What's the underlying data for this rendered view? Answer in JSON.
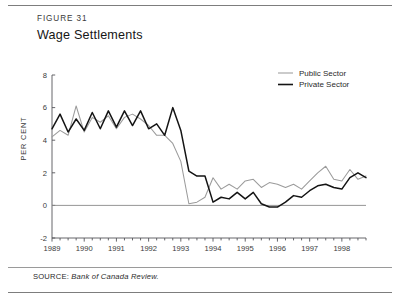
{
  "figure": {
    "label": "FIGURE 31",
    "title": "Wage Settlements",
    "source_key": "SOURCE:",
    "source_value": "Bank of Canada Review."
  },
  "legend": {
    "position": "top-right",
    "items": [
      {
        "label": "Public  Sector",
        "color": "#9b9b9b"
      },
      {
        "label": "Private Sector",
        "color": "#141414"
      }
    ]
  },
  "axes": {
    "ylabel": "PER CENT",
    "yticks": [
      "8",
      "6",
      "4",
      "2",
      "0",
      "-2"
    ],
    "xticks": [
      "1989",
      "1990",
      "1991",
      "1992",
      "1993",
      "1994",
      "1995",
      "1996",
      "1997",
      "1998"
    ]
  },
  "chart_data": {
    "type": "line",
    "title": "Wage Settlements",
    "xlabel": "",
    "ylabel": "PER CENT",
    "ylim": [
      -2,
      8
    ],
    "xlim": [
      1989.0,
      1998.75
    ],
    "grid": false,
    "legend_position": "top-right",
    "zero_line": 0,
    "x": [
      1989.0,
      1989.25,
      1989.5,
      1989.75,
      1990.0,
      1990.25,
      1990.5,
      1990.75,
      1991.0,
      1991.25,
      1991.5,
      1991.75,
      1992.0,
      1992.25,
      1992.5,
      1992.75,
      1993.0,
      1993.25,
      1993.5,
      1993.75,
      1994.0,
      1994.25,
      1994.5,
      1994.75,
      1995.0,
      1995.25,
      1995.5,
      1995.75,
      1996.0,
      1996.25,
      1996.5,
      1996.75,
      1997.0,
      1997.25,
      1997.5,
      1997.75,
      1998.0,
      1998.25,
      1998.5,
      1998.75
    ],
    "series": [
      {
        "name": "Public  Sector",
        "color": "#9b9b9b",
        "values": [
          4.2,
          4.6,
          4.3,
          6.1,
          4.5,
          5.4,
          5.1,
          5.5,
          4.7,
          5.4,
          5.6,
          5.3,
          4.9,
          4.3,
          4.3,
          3.8,
          2.7,
          0.1,
          0.2,
          0.5,
          1.7,
          1.0,
          1.3,
          1.0,
          1.5,
          1.6,
          1.1,
          1.4,
          1.3,
          1.1,
          1.3,
          1.0,
          1.5,
          2.0,
          2.4,
          1.6,
          1.5,
          2.2,
          1.6,
          1.8
        ]
      },
      {
        "name": "Private Sector",
        "color": "#141414",
        "values": [
          4.7,
          5.6,
          4.5,
          5.3,
          4.6,
          5.7,
          4.7,
          5.8,
          4.8,
          5.8,
          4.9,
          5.8,
          4.7,
          5.0,
          4.3,
          6.0,
          4.6,
          2.1,
          1.8,
          1.8,
          0.2,
          0.5,
          0.4,
          0.8,
          0.4,
          0.8,
          0.1,
          -0.1,
          -0.1,
          0.2,
          0.6,
          0.5,
          0.9,
          1.2,
          1.3,
          1.1,
          1.0,
          1.7,
          2.0,
          1.7
        ]
      }
    ]
  }
}
